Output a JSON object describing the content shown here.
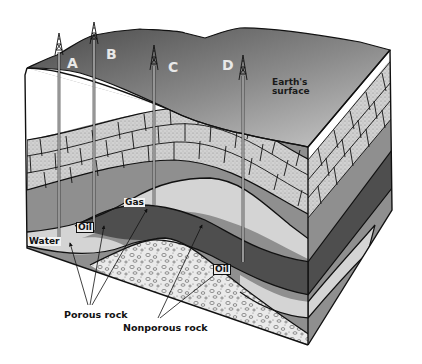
{
  "diagram": {
    "type": "geologic block cross-section",
    "wells": [
      {
        "id": "A",
        "label": "A"
      },
      {
        "id": "B",
        "label": "B"
      },
      {
        "id": "C",
        "label": "C"
      },
      {
        "id": "D",
        "label": "D"
      }
    ],
    "labels": {
      "earth_surface_line1": "Earth's",
      "earth_surface_line2": "surface",
      "gas": "Gas",
      "oil_left": "Oil",
      "oil_right": "Oil",
      "water": "Water",
      "porous_rock": "Porous rock",
      "nonporous_rock": "Nonporous rock"
    },
    "colors": {
      "surface_dark": "#555555",
      "surface_light": "#b8b8b8",
      "topsoil": "#ffffff",
      "limestone": "#cfcfcf",
      "rock_mid": "#8f8f8f",
      "oil": "#4e4e4e",
      "gas_water": "#d6d6d6",
      "gravel": "#e6e6e6",
      "outline": "#111111"
    }
  }
}
